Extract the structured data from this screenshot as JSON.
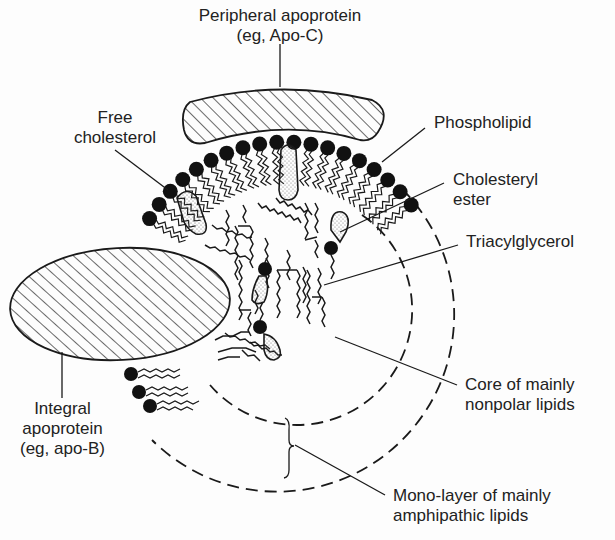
{
  "diagram": {
    "labels": {
      "peripheral_apoprotein": [
        "Peripheral apoprotein",
        "(eg, Apo-C)"
      ],
      "free_cholesterol": [
        "Free",
        "cholesterol"
      ],
      "phospholipid": [
        "Phospholipid"
      ],
      "cholesteryl_ester": [
        "Cholesteryl",
        "ester"
      ],
      "triacylglycerol": [
        "Triacylglycerol"
      ],
      "integral_apoprotein": [
        "Integral",
        "apoprotein",
        "(eg, apo-B)"
      ],
      "core": [
        "Core of mainly",
        "nonpolar lipids"
      ],
      "monolayer": [
        "Mono-layer of mainly",
        "amphipathic lipids"
      ]
    },
    "colors": {
      "ink": "#1a1a1a",
      "background": "#fdfdfd",
      "dots": "#888888"
    },
    "geometry": {
      "center": [
        285,
        300
      ],
      "inner_dashed_radius": 115,
      "outer_dashed_radius": 175,
      "head_arc_radius": 158
    }
  }
}
